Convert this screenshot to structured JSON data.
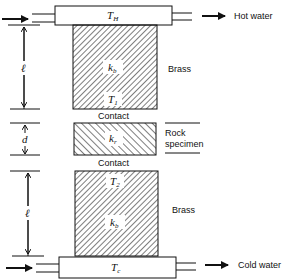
{
  "diagram": {
    "type": "thermal conductivity measurement apparatus (divided bar)",
    "labels": {
      "hot_water": "Hot water",
      "cold_water": "Cold water",
      "brass_top": "Brass",
      "brass_bottom": "Brass",
      "contact_top": "Contact",
      "contact_bottom": "Contact",
      "rock_line1": "Rock",
      "rock_line2": "specimen"
    },
    "symbols": {
      "t_hot": "T",
      "t_hot_sub": "H",
      "t_cold": "T",
      "t_cold_sub": "c",
      "t1": "T",
      "t1_sub": "1",
      "t2": "T",
      "t2_sub": "2",
      "kb_top": "k",
      "kb_top_sub": "b",
      "kb_bottom": "k",
      "kb_bottom_sub": "b",
      "kr": "k",
      "kr_sub": "r",
      "length_top": "ℓ",
      "length_bottom": "ℓ",
      "thickness": "d"
    },
    "colors": {
      "stroke": "#111111",
      "background": "#ffffff"
    }
  }
}
